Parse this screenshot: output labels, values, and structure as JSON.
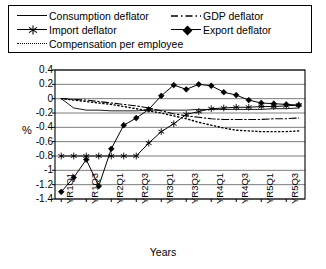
{
  "legend": {
    "items": [
      {
        "label": "Consumption deflator",
        "style": "solid-thin",
        "col": 1,
        "row": 1
      },
      {
        "label": "Import deflator",
        "style": "line-star",
        "col": 1,
        "row": 2
      },
      {
        "label": "Compensation per employee",
        "style": "dotted",
        "col": 1,
        "row": 3
      },
      {
        "label": "GDP deflator",
        "style": "dash-dot",
        "col": 2,
        "row": 1
      },
      {
        "label": "Export deflator",
        "style": "line-diamond",
        "col": 2,
        "row": 2
      }
    ]
  },
  "axes": {
    "ylabel": "%",
    "xlabel": "Years",
    "yticks": [
      "0.4",
      "0.2",
      "0",
      "-0.2",
      "-0.4",
      "-0.6",
      "-0.8",
      "-1",
      "-1.2",
      "-1.4"
    ],
    "xticks": [
      "YR1Q1",
      "YR1Q3",
      "YR2Q1",
      "YR2Q3",
      "YR3Q1",
      "YR3Q3",
      "YR4Q1",
      "YR4Q3",
      "YR5Q1",
      "YR5Q3"
    ]
  },
  "chart_data": {
    "type": "line",
    "title": "",
    "xlabel": "Years",
    "ylabel": "%",
    "ylim": [
      -1.4,
      0.4
    ],
    "ytick_step": 0.2,
    "grid": true,
    "legend_position": "top",
    "x": [
      "YR1Q1",
      "YR1Q2",
      "YR1Q3",
      "YR1Q4",
      "YR2Q1",
      "YR2Q2",
      "YR2Q3",
      "YR2Q4",
      "YR3Q1",
      "YR3Q2",
      "YR3Q3",
      "YR3Q4",
      "YR4Q1",
      "YR4Q2",
      "YR4Q3",
      "YR4Q4",
      "YR5Q1",
      "YR5Q2",
      "YR5Q3",
      "YR5Q4"
    ],
    "xtick_labels": [
      "YR1Q1",
      "YR1Q3",
      "YR2Q1",
      "YR2Q3",
      "YR3Q1",
      "YR3Q3",
      "YR4Q1",
      "YR4Q3",
      "YR5Q1",
      "YR5Q3"
    ],
    "series": [
      {
        "name": "Consumption deflator",
        "style": "solid-thin",
        "values": [
          0.0,
          -0.13,
          -0.16,
          -0.16,
          -0.17,
          -0.17,
          -0.17,
          -0.16,
          -0.16,
          -0.16,
          -0.16,
          -0.15,
          -0.15,
          -0.15,
          -0.15,
          -0.15,
          -0.15,
          -0.14,
          -0.14,
          -0.13
        ]
      },
      {
        "name": "Import deflator",
        "style": "line-star",
        "values": [
          -0.8,
          -0.8,
          -0.8,
          -0.8,
          -0.8,
          -0.8,
          -0.8,
          -0.62,
          -0.46,
          -0.35,
          -0.22,
          -0.18,
          -0.14,
          -0.13,
          -0.12,
          -0.12,
          -0.11,
          -0.11,
          -0.1,
          -0.09
        ]
      },
      {
        "name": "Compensation per employee",
        "style": "dotted",
        "values": [
          0.0,
          -0.02,
          -0.04,
          -0.06,
          -0.08,
          -0.11,
          -0.14,
          -0.17,
          -0.2,
          -0.24,
          -0.28,
          -0.33,
          -0.37,
          -0.41,
          -0.44,
          -0.45,
          -0.46,
          -0.46,
          -0.46,
          -0.45
        ]
      },
      {
        "name": "GDP deflator",
        "style": "dash-dot",
        "values": [
          0.0,
          -0.01,
          -0.02,
          -0.04,
          -0.06,
          -0.08,
          -0.1,
          -0.13,
          -0.17,
          -0.21,
          -0.24,
          -0.26,
          -0.28,
          -0.29,
          -0.29,
          -0.29,
          -0.29,
          -0.28,
          -0.28,
          -0.27
        ]
      },
      {
        "name": "Export deflator",
        "style": "line-diamond",
        "values": [
          -1.3,
          -1.1,
          -0.85,
          -1.22,
          -0.7,
          -0.37,
          -0.27,
          -0.15,
          0.04,
          0.19,
          0.13,
          0.2,
          0.18,
          0.09,
          0.05,
          -0.02,
          -0.06,
          -0.07,
          -0.08,
          -0.09
        ]
      }
    ]
  }
}
